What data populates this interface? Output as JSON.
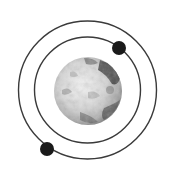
{
  "diagram": {
    "center": [
      87.5,
      90
    ],
    "colors": {
      "background": "#ffffff",
      "orbit": "#3a3a3a",
      "moon": "#1a1a1a",
      "planet_light": "#ececec",
      "planet_mid": "#b8b8b8",
      "planet_dark": "#4a4a4a"
    },
    "planet": {
      "cx": 88,
      "cy": 91,
      "r": 34
    },
    "orbits": [
      {
        "name": "inner-orbit",
        "r": 53
      },
      {
        "name": "outer-orbit",
        "r": 69
      }
    ],
    "moons": [
      {
        "name": "inner-moon",
        "cx": 119,
        "cy": 48,
        "r": 7
      },
      {
        "name": "outer-moon",
        "cx": 47,
        "cy": 149,
        "r": 7
      }
    ]
  }
}
